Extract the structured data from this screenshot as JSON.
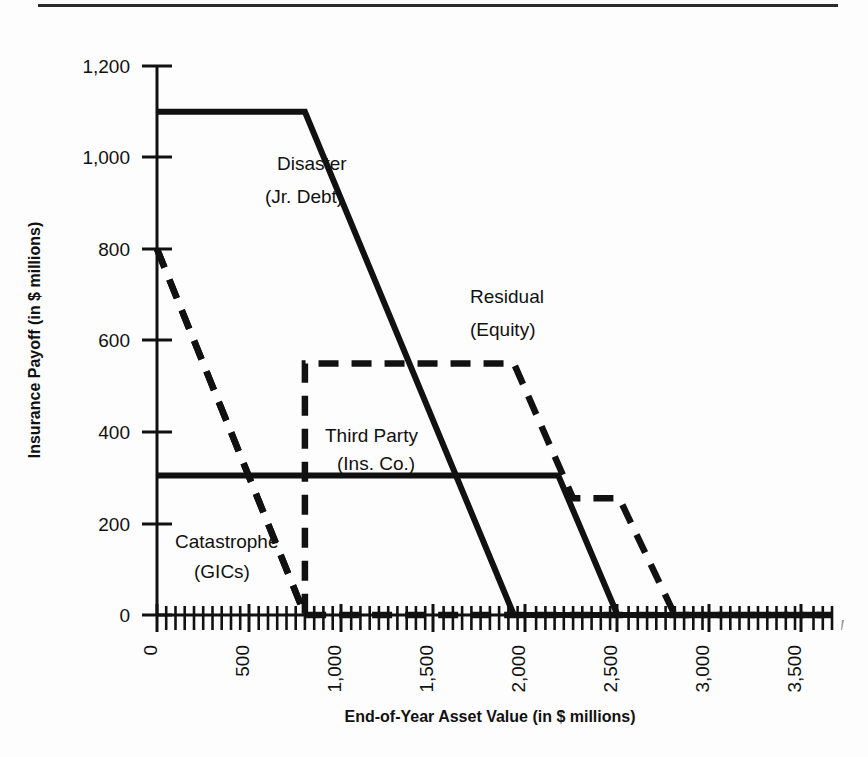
{
  "figure": {
    "background_color": "#fdfdfd",
    "ink_color": "#111111"
  },
  "axes": {
    "x_title": "End-of-Year Asset Value (in $ millions)",
    "y_title": "Insurance Payoff (in $ millions)",
    "x_tick_labels": [
      "0",
      "500",
      "1,000",
      "1,500",
      "2,000",
      "2,500",
      "3,000",
      "3,500"
    ],
    "y_tick_labels": [
      "0",
      "200",
      "400",
      "600",
      "800",
      "1,000",
      "1,200"
    ]
  },
  "series_labels": {
    "disaster_line1": "Disaster",
    "disaster_line2": "(Jr. Debt)",
    "residual_line1": "Residual",
    "residual_line2": "(Equity)",
    "third_party_line1": "Third Party",
    "third_party_line2": "(Ins. Co.)",
    "catastrophe_line1": "Catastrophe",
    "catastrophe_line2": "(GICs)"
  },
  "chart_data": {
    "type": "line",
    "title": "",
    "xlabel": "End-of-Year Asset Value (in $ millions)",
    "ylabel": "Insurance Payoff (in $ millions)",
    "xlim": [
      0,
      3650
    ],
    "ylim": [
      0,
      1200
    ],
    "x_ticks": [
      0,
      500,
      1000,
      1500,
      2000,
      2500,
      3000,
      3500
    ],
    "y_ticks": [
      0,
      200,
      400,
      600,
      800,
      1000,
      1200
    ],
    "x_minor_tick_step": 50,
    "grid": false,
    "legend": "inline-annotations",
    "series": [
      {
        "name": "Disaster (Jr. Debt)",
        "style": "solid",
        "points": [
          [
            0,
            1100
          ],
          [
            800,
            1100
          ],
          [
            1930,
            0
          ],
          [
            3650,
            0
          ]
        ]
      },
      {
        "name": "Residual (Equity)",
        "style": "dashed",
        "points": [
          [
            0,
            800
          ],
          [
            800,
            0
          ],
          [
            800,
            550
          ],
          [
            1930,
            550
          ],
          [
            2250,
            255
          ],
          [
            2500,
            255
          ],
          [
            2800,
            0
          ],
          [
            3650,
            0
          ]
        ]
      },
      {
        "name": "Third Party (Ins. Co.)",
        "style": "solid",
        "points": [
          [
            0,
            305
          ],
          [
            2170,
            305
          ],
          [
            2490,
            0
          ],
          [
            3650,
            0
          ]
        ]
      },
      {
        "name": "Catastrophe (GICs)",
        "style": "dashed",
        "points": [
          [
            0,
            800
          ],
          [
            800,
            0
          ],
          [
            3650,
            0
          ]
        ]
      }
    ],
    "annotations": [
      {
        "text": "Disaster (Jr. Debt)",
        "x": 1000,
        "y": 1000
      },
      {
        "text": "Residual (Equity)",
        "x": 2200,
        "y": 650
      },
      {
        "text": "Third Party (Ins. Co.)",
        "x": 1400,
        "y": 420
      },
      {
        "text": "Catastrophe (GICs)",
        "x": 500,
        "y": 130
      }
    ]
  }
}
